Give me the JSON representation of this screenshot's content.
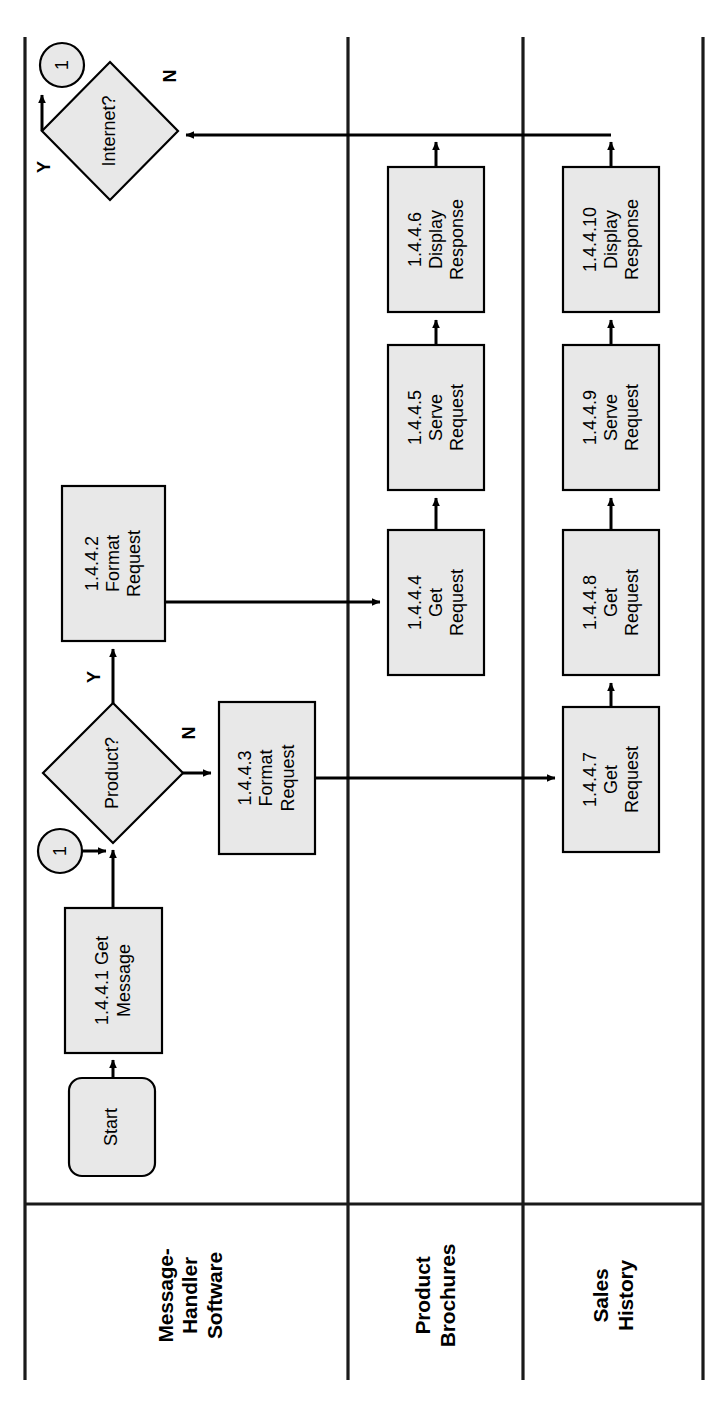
{
  "diagram": {
    "orientation": "rotated-90-ccw",
    "colors": {
      "shape_fill": "#e8e8e8",
      "shape_stroke": "#000000",
      "lane_line": "#1a1a1a",
      "connector_line": "#000000",
      "background": "#ffffff"
    }
  },
  "lanes": [
    {
      "id": "lane-message-handler",
      "label": "Message-\nHandler\nSoftware"
    },
    {
      "id": "lane-product-brochures",
      "label": "Product\nBrochures"
    },
    {
      "id": "lane-sales-history",
      "label": "Sales\nHistory"
    }
  ],
  "nodes": {
    "start": {
      "label": "Start",
      "shape": "terminator",
      "lane": "lane-message-handler"
    },
    "n1": {
      "label": "1.4.4.1 Get\nMessage",
      "shape": "process",
      "lane": "lane-message-handler"
    },
    "d_product": {
      "label": "Product?",
      "shape": "decision",
      "lane": "lane-message-handler"
    },
    "n2": {
      "label": "1.4.4.2\nFormat\nRequest",
      "shape": "process",
      "lane": "lane-message-handler"
    },
    "n3": {
      "label": "1.4.4.3\nFormat\nRequest",
      "shape": "process",
      "lane": "lane-message-handler"
    },
    "d_internet": {
      "label": "Internet?",
      "shape": "decision",
      "lane": "lane-message-handler"
    },
    "n4": {
      "label": "1.4.4.4\nGet\nRequest",
      "shape": "process",
      "lane": "lane-product-brochures"
    },
    "n5": {
      "label": "1.4.4.5\nServe\nRequest",
      "shape": "process",
      "lane": "lane-product-brochures"
    },
    "n6": {
      "label": "1.4.4.6\nDisplay\nResponse",
      "shape": "process",
      "lane": "lane-product-brochures"
    },
    "n7": {
      "label": "1.4.4.7\nGet\nRequest",
      "shape": "process",
      "lane": "lane-sales-history"
    },
    "n8": {
      "label": "1.4.4.8\nGet\nRequest",
      "shape": "process",
      "lane": "lane-sales-history"
    },
    "n9": {
      "label": "1.4.4.9\nServe\nRequest",
      "shape": "process",
      "lane": "lane-sales-history"
    },
    "n10": {
      "label": "1.4.4.10\nDisplay\nResponse",
      "shape": "process",
      "lane": "lane-sales-history"
    }
  },
  "connectors": {
    "c_top": {
      "label": "1",
      "shape": "off-page-connector"
    },
    "c_mid": {
      "label": "1",
      "shape": "off-page-connector"
    }
  },
  "edge_labels": {
    "product_yes": "Y",
    "product_no": "N",
    "internet_yes": "Y",
    "internet_no": "N"
  }
}
